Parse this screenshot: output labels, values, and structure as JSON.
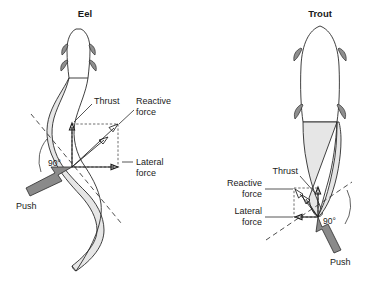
{
  "figure": {
    "background_color": "#ffffff",
    "ink_color": "#1a1a1a",
    "shade_color": "#e6e6e6",
    "push_arrow_color": "#8a8a8a"
  },
  "panels": [
    {
      "id": "eel",
      "title": "Eel",
      "angle_label": "90°",
      "labels": {
        "thrust": "Thrust",
        "reactive_force_line1": "Reactive",
        "reactive_force_line2": "force",
        "lateral_force_line1": "Lateral",
        "lateral_force_line2": "force",
        "push": "Push"
      }
    },
    {
      "id": "trout",
      "title": "Trout",
      "angle_label": "90°",
      "labels": {
        "thrust": "Thrust",
        "reactive_force_line1": "Reactive",
        "reactive_force_line2": "force",
        "lateral_force_line1": "Lateral",
        "lateral_force_line2": "force",
        "push": "Push"
      }
    }
  ]
}
